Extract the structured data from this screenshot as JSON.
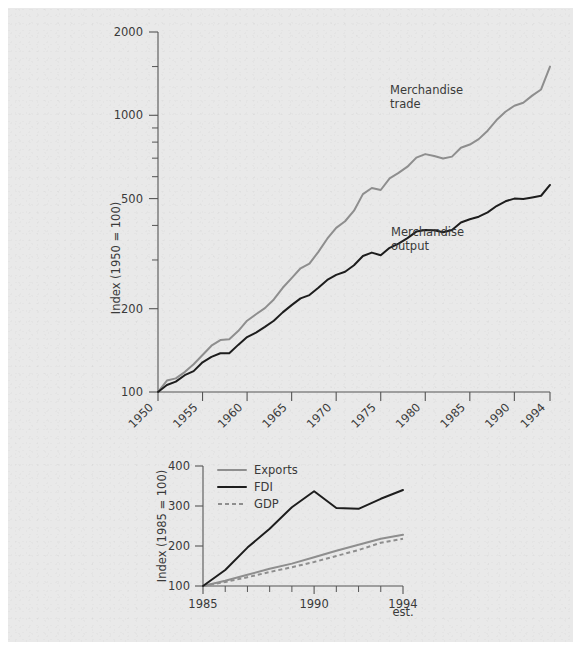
{
  "figure": {
    "background_color": "#e9e9e9",
    "page_color": "#ffffff"
  },
  "colors": {
    "dark_series": "#1d1d1d",
    "gray_series": "#8e8e8e",
    "axis": "#555555",
    "text": "#3a3a3a"
  },
  "chart_data": [
    {
      "type": "line",
      "id": "world-merchandise-trade-and-output",
      "title": "",
      "xlabel": "",
      "ylabel": "Index (1950 = 100)",
      "yscale": "log",
      "ylim": [
        100,
        2000
      ],
      "ytick_labels": [
        "100",
        "200",
        "500",
        "1000",
        "2000"
      ],
      "ytick_values": [
        100,
        200,
        500,
        1000,
        2000
      ],
      "xlim": [
        1950,
        1994
      ],
      "xtick_labels": [
        "1950",
        "1955",
        "1960",
        "1965",
        "1970",
        "1975",
        "1980",
        "1985",
        "1990",
        "1994"
      ],
      "xtick_values": [
        1950,
        1955,
        1960,
        1965,
        1970,
        1975,
        1980,
        1985,
        1990,
        1994
      ],
      "xtick_rotation_deg": 45,
      "grid": false,
      "legend": "annotations",
      "annotations": [
        {
          "text": "Merchandise trade",
          "lines": [
            "Merchandise",
            "trade"
          ],
          "x": 1977,
          "y": 1080
        },
        {
          "text": "Merchandise output",
          "lines": [
            "Merchandise",
            "output"
          ],
          "x": 1978,
          "y": 300
        }
      ],
      "x": [
        1950,
        1951,
        1952,
        1953,
        1954,
        1955,
        1956,
        1957,
        1958,
        1959,
        1960,
        1961,
        1962,
        1963,
        1964,
        1965,
        1966,
        1967,
        1968,
        1969,
        1970,
        1971,
        1972,
        1973,
        1974,
        1975,
        1976,
        1977,
        1978,
        1979,
        1980,
        1981,
        1982,
        1983,
        1984,
        1985,
        1986,
        1987,
        1988,
        1989,
        1990,
        1991,
        1992,
        1993,
        1994
      ],
      "series": [
        {
          "name": "Merchandise trade",
          "color": "#8e8e8e",
          "style": "solid",
          "values": [
            100,
            110,
            112,
            118,
            126,
            136,
            147,
            154,
            155,
            166,
            181,
            191,
            201,
            216,
            238,
            258,
            280,
            291,
            321,
            358,
            392,
            414,
            452,
            519,
            546,
            537,
            592,
            619,
            652,
            703,
            724,
            713,
            698,
            709,
            763,
            784,
            820,
            880,
            961,
            1030,
            1083,
            1110,
            1178,
            1240,
            1500
          ]
        },
        {
          "name": "Merchandise output",
          "color": "#1d1d1d",
          "style": "solid",
          "values": [
            100,
            106,
            109,
            115,
            119,
            128,
            134,
            138,
            138,
            148,
            158,
            164,
            172,
            181,
            194,
            206,
            218,
            224,
            238,
            254,
            265,
            272,
            287,
            310,
            319,
            312,
            332,
            344,
            360,
            380,
            385,
            384,
            378,
            385,
            410,
            421,
            430,
            446,
            470,
            489,
            500,
            498,
            505,
            512,
            560
          ]
        }
      ]
    },
    {
      "type": "line",
      "id": "exports-fdi-gdp",
      "title": "",
      "xlabel": "",
      "ylabel": "Index (1985 = 100)",
      "yscale": "linear",
      "ylim": [
        100,
        400
      ],
      "ytick_labels": [
        "100",
        "200",
        "300",
        "400"
      ],
      "ytick_values": [
        100,
        200,
        300,
        400
      ],
      "xlim": [
        1985,
        1994
      ],
      "xtick_labels": [
        "1985",
        "1990",
        "1994"
      ],
      "xtick_values": [
        1985,
        1990,
        1994
      ],
      "xtick_minor_values": [
        1986,
        1987,
        1988,
        1989,
        1991,
        1992,
        1993
      ],
      "x_note": "est.",
      "grid": false,
      "legend_position": "top-left",
      "x": [
        1985,
        1986,
        1987,
        1988,
        1989,
        1990,
        1991,
        1992,
        1993,
        1994
      ],
      "series": [
        {
          "name": "Exports",
          "color": "#8e8e8e",
          "style": "solid",
          "values": [
            100,
            113,
            128,
            143,
            156,
            172,
            188,
            203,
            218,
            228
          ]
        },
        {
          "name": "FDI",
          "color": "#1d1d1d",
          "style": "solid",
          "values": [
            100,
            140,
            196,
            243,
            297,
            337,
            295,
            293,
            318,
            340
          ]
        },
        {
          "name": "GDP",
          "color": "#8e8e8e",
          "style": "dashed",
          "values": [
            100,
            110,
            122,
            135,
            147,
            160,
            175,
            190,
            208,
            218
          ]
        }
      ]
    }
  ]
}
